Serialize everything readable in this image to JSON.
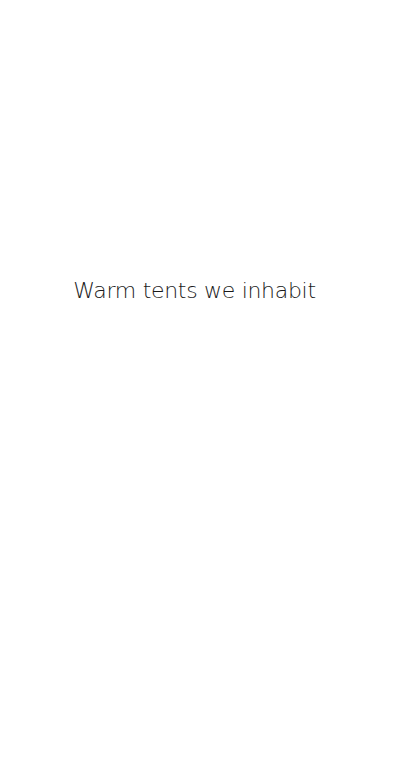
{
  "screen": {
    "background_color": "#ffffff",
    "text_color": "#1a1a1a"
  },
  "content": {
    "caption": "Warm tents we inhabit"
  }
}
